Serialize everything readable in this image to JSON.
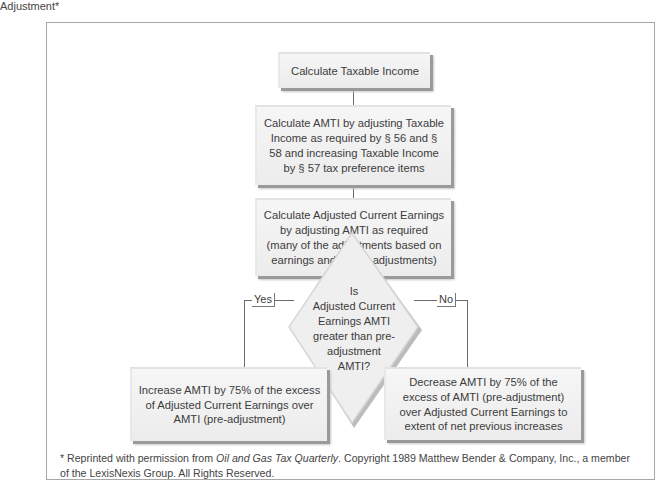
{
  "caption": "Adjustment*",
  "flowchart": {
    "step1": "Calculate Taxable Income",
    "step2": "Calculate AMTI by adjusting Taxable Income as required by § 56 and § 58 and increasing Taxable Income by § 57 tax preference items",
    "step3": "Calculate Adjusted Current Earnings by adjusting AMTI as required (many of the adjustments based on earnings and profits adjustments)",
    "decision": {
      "line1": "Is",
      "line2": "Adjusted Current Earnings AMTI greater than pre-adjustment AMTI?"
    },
    "yes_label": "Yes",
    "no_label": "No",
    "yes_outcome": "Increase AMTI by 75% of the excess of Adjusted Current Earnings over AMTI (pre-adjustment)",
    "no_outcome": "Decrease AMTI by 75% of the excess of AMTI (pre-adjustment) over Adjusted Current Earnings to extent of net previous increases"
  },
  "footnote": {
    "prefix": "* Reprinted with permission from ",
    "source": "Oil and Gas Tax Quarterly",
    "suffix": ". Copyright 1989 Matthew Bender & Company, Inc., a member of the LexisNexis Group. All Rights Reserved."
  }
}
